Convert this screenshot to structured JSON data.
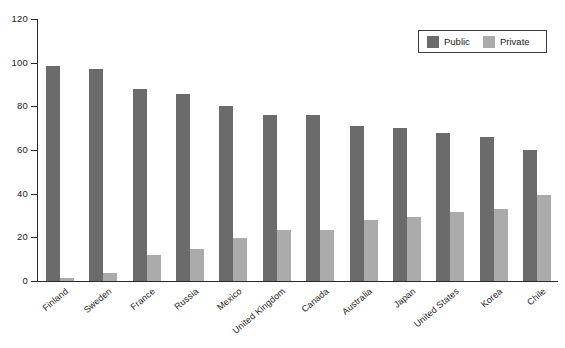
{
  "chart_data": {
    "type": "bar",
    "title": "",
    "subtitle": "",
    "xlabel": "",
    "ylabel": "",
    "ylim": [
      0,
      120
    ],
    "yticks": [
      0,
      20,
      40,
      60,
      80,
      100,
      120
    ],
    "grid": false,
    "legend_position": "top-right",
    "categories": [
      "Finland",
      "Sweden",
      "France",
      "Russia",
      "Mexico",
      "United Kingdom",
      "Canada",
      "Australia",
      "Japan",
      "United States",
      "Korea",
      "Chile"
    ],
    "series": [
      {
        "name": "Public",
        "color": "#6b6b6b",
        "values": [
          98.5,
          97,
          88,
          85.5,
          80,
          76,
          76,
          71,
          70,
          68,
          66,
          60
        ]
      },
      {
        "name": "Private",
        "color": "#ababab",
        "values": [
          1.5,
          3.5,
          12,
          14.5,
          19.5,
          23.5,
          23.5,
          28,
          29.5,
          31.5,
          33,
          39.5
        ]
      }
    ]
  },
  "legend": {
    "entries": [
      {
        "label": "Public",
        "color": "#6b6b6b"
      },
      {
        "label": "Private",
        "color": "#ababab"
      }
    ]
  },
  "axis": {
    "y_tick_labels": [
      "0",
      "20",
      "40",
      "60",
      "80",
      "100",
      "120"
    ]
  }
}
